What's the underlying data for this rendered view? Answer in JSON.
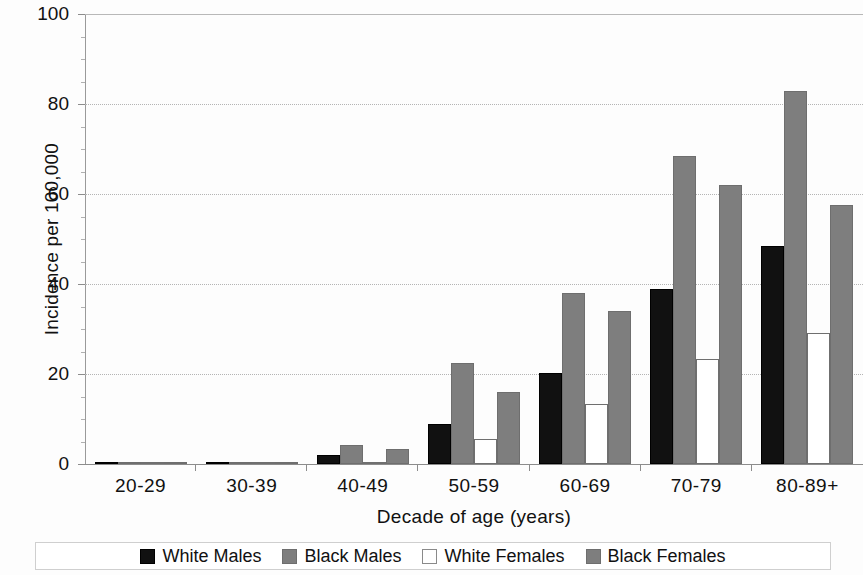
{
  "chart_data": {
    "type": "bar",
    "title": "",
    "xlabel": "Decade of age (years)",
    "ylabel": "Incidence per 100,000",
    "categories": [
      "20-29",
      "30-39",
      "40-49",
      "50-59",
      "60-69",
      "70-79",
      "80-89+"
    ],
    "series": [
      {
        "name": "White Males",
        "color": "#111111",
        "values": [
          0.3,
          0.3,
          2.0,
          8.8,
          20.3,
          38.8,
          48.5
        ]
      },
      {
        "name": "Black Males",
        "color": "#7e7e7e",
        "values": [
          0.4,
          0.3,
          4.3,
          22.4,
          38.1,
          68.4,
          82.8
        ]
      },
      {
        "name": "White Females",
        "color": "#ffffff",
        "values": [
          0.1,
          0.2,
          0.5,
          5.5,
          13.4,
          23.4,
          29.1
        ]
      },
      {
        "name": "Black Females",
        "color": "#7e7e7e",
        "values": [
          0.4,
          0.5,
          3.3,
          15.9,
          33.9,
          62.0,
          57.5
        ]
      }
    ],
    "ylim": [
      0,
      100
    ],
    "yticks": [
      0,
      20,
      40,
      60,
      80,
      100
    ],
    "ytick_labels": [
      "0",
      "20",
      "40",
      "60",
      "80",
      "100"
    ],
    "grid": true,
    "grid_style": "dotted",
    "legend_position": "bottom",
    "legend_entries": [
      "White Males",
      "Black Males",
      "White Females",
      "Black Females"
    ]
  }
}
